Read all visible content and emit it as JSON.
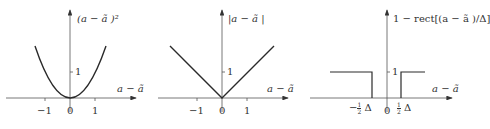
{
  "panels": [
    {
      "id": "squared-error",
      "y_label": "(a − ã )²",
      "x_label": "a − ã",
      "x_ticks": [
        "−1",
        "0",
        "1"
      ],
      "y_tick": "1"
    },
    {
      "id": "absolute-error",
      "y_label": "|a − ã |",
      "x_label": "a − ã",
      "x_ticks": [
        "−1",
        "0",
        "1"
      ],
      "y_tick": "1"
    },
    {
      "id": "uniform-error",
      "y_label": "1 − rect[(a − ã )/Δ]",
      "x_label": "a − ã",
      "x_ticks": [
        "−",
        "0",
        ""
      ],
      "half_num": "1",
      "half_den": "2",
      "delta": "Δ",
      "y_tick": "1"
    }
  ],
  "colors": {
    "line": "#2a2a2a",
    "axis": "#555555",
    "text": "#333333"
  }
}
